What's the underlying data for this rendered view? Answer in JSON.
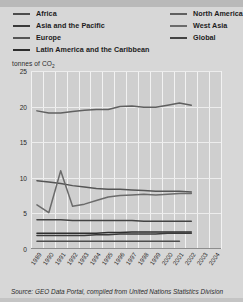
{
  "legend": {
    "left_column": [
      {
        "label": "Africa",
        "color": "#4d4d4d"
      },
      {
        "label": "Asia and the Pacific",
        "color": "#3a3a3a"
      },
      {
        "label": "Europe",
        "color": "#555555"
      },
      {
        "label": "Latin America and the Caribbean",
        "color": "#2e2e2e"
      }
    ],
    "right_column": [
      {
        "label": "North America",
        "color": "#606060"
      },
      {
        "label": "West Asia",
        "color": "#6b6b6b"
      },
      {
        "label": "Global",
        "color": "#434343"
      }
    ]
  },
  "source": {
    "text": "Source: GEO Data Portal, compiled from United Nations Statistics Division"
  },
  "chart_data": {
    "type": "line",
    "title": "",
    "xlabel": "",
    "ylabel": "tonnes of CO2",
    "ylabel_display": "tonnes of CO",
    "ylabel_sub": "2",
    "ylim": [
      0,
      25
    ],
    "yticks": [
      0,
      5,
      10,
      15,
      20,
      25
    ],
    "grid": true,
    "legend_position": "top",
    "x": [
      1989,
      1990,
      1991,
      1992,
      1993,
      1994,
      1995,
      1996,
      1997,
      1998,
      1999,
      2000,
      2001,
      2002,
      2003,
      2004
    ],
    "categories": [
      "1989",
      "1990",
      "1991",
      "1992",
      "1993",
      "1994",
      "1995",
      "1996",
      "1997",
      "1998",
      "1999",
      "2000",
      "2001",
      "2002",
      "2003",
      "2004"
    ],
    "series": [
      {
        "name": "North America",
        "color": "#606060",
        "values": [
          19.4,
          19.1,
          19.1,
          19.3,
          19.5,
          19.6,
          19.6,
          20.0,
          20.1,
          19.9,
          19.9,
          20.2,
          20.5,
          20.2,
          null,
          null
        ]
      },
      {
        "name": "Europe",
        "color": "#555555",
        "values": [
          9.6,
          9.4,
          9.2,
          8.9,
          8.7,
          8.5,
          8.4,
          8.4,
          8.3,
          8.2,
          8.1,
          8.1,
          8.1,
          8.0,
          null,
          null
        ]
      },
      {
        "name": "West Asia",
        "color": "#6b6b6b",
        "values": [
          6.2,
          5.1,
          11.0,
          6.0,
          6.3,
          6.8,
          7.3,
          7.5,
          7.6,
          7.7,
          7.6,
          7.7,
          7.8,
          7.8,
          null,
          null
        ]
      },
      {
        "name": "Global",
        "color": "#434343",
        "values": [
          4.1,
          4.1,
          4.1,
          4.0,
          4.0,
          4.0,
          4.0,
          4.0,
          4.0,
          3.9,
          3.9,
          3.9,
          3.9,
          3.9,
          null,
          null
        ]
      },
      {
        "name": "Latin America and the Caribbean",
        "color": "#2e2e2e",
        "values": [
          2.2,
          2.2,
          2.2,
          2.2,
          2.2,
          2.2,
          2.3,
          2.3,
          2.4,
          2.4,
          2.4,
          2.4,
          2.4,
          2.4,
          null,
          null
        ]
      },
      {
        "name": "Asia and the Pacific",
        "color": "#3a3a3a",
        "values": [
          1.9,
          1.9,
          1.9,
          1.9,
          1.9,
          2.0,
          2.0,
          2.1,
          2.1,
          2.1,
          2.1,
          2.2,
          2.2,
          2.2,
          null,
          null
        ]
      },
      {
        "name": "Africa",
        "color": "#4d4d4d",
        "values": [
          1.1,
          1.1,
          1.1,
          1.1,
          1.1,
          1.1,
          1.1,
          1.1,
          1.1,
          1.1,
          1.1,
          1.1,
          1.1,
          null,
          null,
          null
        ]
      }
    ]
  }
}
